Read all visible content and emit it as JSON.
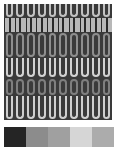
{
  "texture": {
    "tile_width_px": 10.8,
    "columns": 10,
    "bands": [
      {
        "kind": "u",
        "top": 0,
        "height": 14,
        "fg": "#c2c2c2",
        "bg": "#3a3a3a"
      },
      {
        "kind": "s",
        "top": 14,
        "height": 14,
        "fg": "#bdbdbd",
        "bg": "#b8b8b8"
      },
      {
        "kind": "o",
        "top": 28,
        "height": 26,
        "fg": "#8e8e8e",
        "bg": "#3a3a3a"
      },
      {
        "kind": "u",
        "top": 54,
        "height": 20,
        "fg": "#d2d2d2",
        "bg": "#3a3a3a"
      },
      {
        "kind": "o",
        "top": 74,
        "height": 18,
        "fg": "#7f7f7f",
        "bg": "#3a3a3a"
      },
      {
        "kind": "u",
        "top": 92,
        "height": 24,
        "fg": "#cfcfcf",
        "bg": "#3a3a3a"
      }
    ]
  },
  "palette": {
    "swatches": [
      {
        "color": "#252525"
      },
      {
        "color": "#8c8c8c"
      },
      {
        "color": "#a0a0a0"
      },
      {
        "color": "#d6d6d6"
      },
      {
        "color": "#acacac"
      }
    ]
  }
}
